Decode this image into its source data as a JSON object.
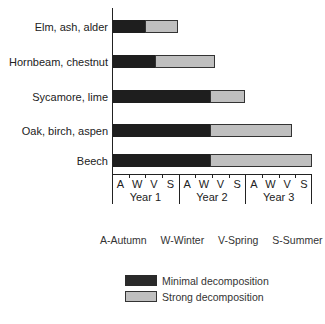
{
  "chart_data": {
    "type": "bar",
    "orientation": "horizontal",
    "stacked": true,
    "title": "",
    "xlabel": "",
    "ylabel": "",
    "categories": [
      "Elm, ash, alder",
      "Hornbeam, chestnut",
      "Sycamore, lime",
      "Oak, birch, aspen",
      "Beech"
    ],
    "unit": "seasons from start (Autumn, Year 1)",
    "xlim": [
      0,
      12
    ],
    "series": [
      {
        "name": "Minimal decomposition",
        "color": "#1e1e1e",
        "values": [
          2.0,
          2.6,
          5.9,
          5.9,
          5.9
        ]
      },
      {
        "name": "Strong decomposition",
        "color": "#dddddd",
        "pattern": "stipple",
        "values": [
          2.0,
          3.6,
          2.1,
          4.9,
          6.1
        ]
      }
    ],
    "x_ticks": {
      "seasons": [
        "A",
        "W",
        "V",
        "S",
        "A",
        "W",
        "V",
        "S",
        "A",
        "W",
        "V",
        "S"
      ],
      "years": [
        "Year 1",
        "Year 2",
        "Year 3"
      ]
    },
    "season_key": [
      "A-Autumn",
      "W-Winter",
      "V-Spring",
      "S-Summer"
    ],
    "legend": [
      {
        "label": "Minimal decomposition",
        "style": "dark"
      },
      {
        "label": "Strong decomposition",
        "style": "stippled"
      }
    ],
    "grid": false,
    "legend_position": "bottom"
  }
}
